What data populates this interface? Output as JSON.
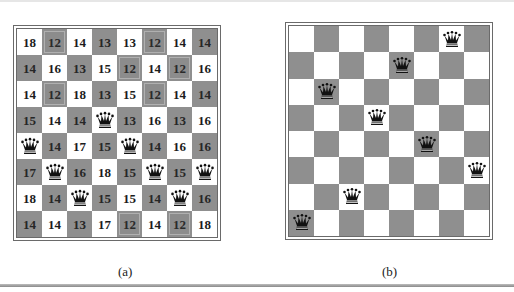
{
  "figure": {
    "panels": [
      {
        "id": "a",
        "caption": "(a)",
        "description": "8-queens state with heuristic cost values for each possible move; best moves (value 12) highlighted",
        "cells": [
          [
            "18",
            "12",
            "14",
            "13",
            "13",
            "12",
            "14",
            "14"
          ],
          [
            "14",
            "16",
            "13",
            "15",
            "12",
            "14",
            "12",
            "16"
          ],
          [
            "14",
            "12",
            "18",
            "13",
            "15",
            "12",
            "14",
            "14"
          ],
          [
            "15",
            "14",
            "14",
            "Q",
            "13",
            "16",
            "13",
            "16"
          ],
          [
            "Q",
            "14",
            "17",
            "15",
            "Q",
            "14",
            "16",
            "16"
          ],
          [
            "17",
            "Q",
            "16",
            "18",
            "15",
            "Q",
            "15",
            "Q"
          ],
          [
            "18",
            "14",
            "Q",
            "15",
            "15",
            "14",
            "Q",
            "16"
          ],
          [
            "14",
            "14",
            "13",
            "17",
            "12",
            "14",
            "12",
            "18"
          ]
        ],
        "highlighted_best": [
          [
            0,
            1
          ],
          [
            0,
            5
          ],
          [
            1,
            4
          ],
          [
            1,
            6
          ],
          [
            2,
            1
          ],
          [
            2,
            5
          ],
          [
            7,
            4
          ],
          [
            7,
            6
          ]
        ],
        "best_value": "12"
      },
      {
        "id": "b",
        "caption": "(b)",
        "description": "8-queens local minimum state",
        "queen_columns_by_row": [
          6,
          4,
          1,
          3,
          5,
          7,
          2,
          0
        ]
      }
    ]
  },
  "colors": {
    "dark_square": "#8f8f8f",
    "light_square": "#ffffff",
    "border": "#6a6a6a",
    "queen": "#111111"
  },
  "icons": {
    "queen": "queen-icon"
  }
}
